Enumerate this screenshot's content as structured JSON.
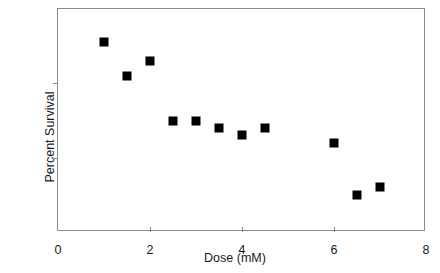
{
  "chart_data": {
    "type": "scatter",
    "title": "",
    "xlabel": "Dose (mM)",
    "ylabel": "Percent Survival",
    "xlim": [
      0,
      8
    ],
    "ylim": [
      97,
      100
    ],
    "xticks": [
      0,
      2,
      4,
      6,
      8
    ],
    "yticks": [
      97,
      98,
      99,
      100
    ],
    "xtick_labels": [
      "0",
      "2",
      "4",
      "6",
      "8"
    ],
    "ytick_labels": [
      "97",
      "98",
      "99",
      "100"
    ],
    "grid": false,
    "legend": null,
    "marker": "square",
    "marker_color": "#000000",
    "marker_size_px": 9,
    "series": [
      {
        "name": "Percent Survival vs Dose",
        "x": [
          1.0,
          1.5,
          2.0,
          2.5,
          3.0,
          3.5,
          4.0,
          4.5,
          6.0,
          6.5,
          7.0
        ],
        "y": [
          99.55,
          99.1,
          99.3,
          98.5,
          98.5,
          98.4,
          98.3,
          98.4,
          98.2,
          97.5,
          97.6
        ]
      }
    ],
    "points": [
      {
        "x": 1.0,
        "y": 99.55
      },
      {
        "x": 1.5,
        "y": 99.1
      },
      {
        "x": 2.0,
        "y": 99.3
      },
      {
        "x": 2.5,
        "y": 98.5
      },
      {
        "x": 3.0,
        "y": 98.5
      },
      {
        "x": 3.5,
        "y": 98.4
      },
      {
        "x": 4.0,
        "y": 98.3
      },
      {
        "x": 4.5,
        "y": 98.4
      },
      {
        "x": 6.0,
        "y": 98.2
      },
      {
        "x": 6.5,
        "y": 97.5
      },
      {
        "x": 7.0,
        "y": 97.6
      }
    ]
  },
  "axes": {
    "frame_color": "#8a8a8a",
    "text_color": "#1a1a1a"
  }
}
